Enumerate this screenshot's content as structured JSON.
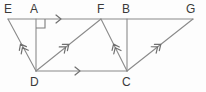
{
  "figure": {
    "type": "geometry-diagram",
    "width": 206,
    "height": 92,
    "colors": {
      "background": "#fdfdfd",
      "stroke": "#8a8a8a",
      "stroke_dark": "#6f6f6f",
      "label": "#3a3a3a"
    },
    "labels": [
      {
        "id": "E",
        "text": "E",
        "x": 4,
        "y": 3
      },
      {
        "id": "A",
        "text": "A",
        "x": 30,
        "y": 3
      },
      {
        "id": "F",
        "text": "F",
        "x": 97,
        "y": 3
      },
      {
        "id": "B",
        "text": "B",
        "x": 122,
        "y": 3
      },
      {
        "id": "G",
        "text": "G",
        "x": 186,
        "y": 3
      },
      {
        "id": "D",
        "text": "D",
        "x": 30,
        "y": 76
      },
      {
        "id": "C",
        "text": "C",
        "x": 122,
        "y": 76
      }
    ],
    "points": {
      "E": {
        "x": 8,
        "y": 19
      },
      "A": {
        "x": 36,
        "y": 19
      },
      "F": {
        "x": 101,
        "y": 19
      },
      "B": {
        "x": 127,
        "y": 19
      },
      "G": {
        "x": 193,
        "y": 19
      },
      "D": {
        "x": 36,
        "y": 71
      },
      "C": {
        "x": 127,
        "y": 71
      }
    },
    "segments": [
      {
        "id": "EG",
        "from": "E",
        "to": "G",
        "marks": 0,
        "note": "upper horizontal line through E, A, F, B, G"
      },
      {
        "id": "DC",
        "from": "D",
        "to": "C",
        "marks": 1,
        "note": "lower horizontal line"
      },
      {
        "id": "AD",
        "from": "A",
        "to": "D",
        "marks": 0,
        "note": "vertical, perpendicular to EG"
      },
      {
        "id": "BC",
        "from": "B",
        "to": "C",
        "marks": 0,
        "note": "vertical"
      },
      {
        "id": "ED",
        "from": "D",
        "to": "E",
        "marks": 2
      },
      {
        "id": "DF",
        "from": "D",
        "to": "F",
        "marks": 2
      },
      {
        "id": "CF",
        "from": "C",
        "to": "F",
        "marks": 2
      },
      {
        "id": "CG",
        "from": "C",
        "to": "G",
        "marks": 2
      }
    ],
    "arrow_marks": [
      {
        "id": "mark-AF",
        "on": "EG",
        "chevrons": 1,
        "x": 60,
        "y": 19,
        "angle": 0
      },
      {
        "id": "mark-DC",
        "on": "DC",
        "chevrons": 1,
        "x": 79,
        "y": 71,
        "angle": 0
      },
      {
        "id": "mark-DE",
        "on": "ED",
        "chevrons": 2,
        "x": 21,
        "y": 45,
        "angle": -118
      },
      {
        "id": "mark-DF",
        "on": "DF",
        "chevrons": 2,
        "x": 68,
        "y": 45,
        "angle": -39
      },
      {
        "id": "mark-CF",
        "on": "CF",
        "chevrons": 2,
        "x": 114,
        "y": 45,
        "angle": -115
      },
      {
        "id": "mark-CG",
        "on": "CG",
        "chevrons": 2,
        "x": 160,
        "y": 45,
        "angle": -38
      }
    ],
    "right_angle": {
      "id": "right-angle-A",
      "at": "A",
      "x": 36,
      "y": 19,
      "size": 9,
      "note": "square mark indicating AD perpendicular to EG, drawn below-right of A"
    }
  }
}
